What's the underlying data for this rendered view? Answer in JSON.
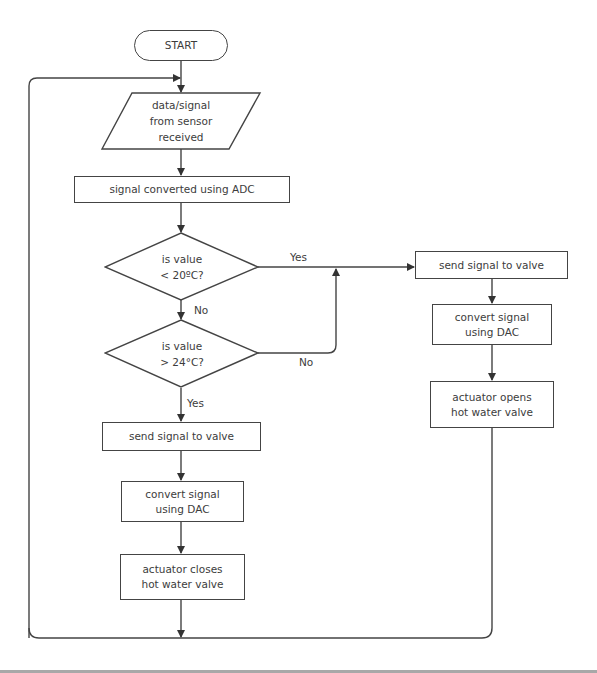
{
  "diagram": {
    "type": "flowchart",
    "title": "",
    "colors": {
      "stroke": "#444444",
      "text": "#3c3c3c",
      "background": "#ffffff",
      "rule": "#a8a8a8"
    },
    "nodes": {
      "start": {
        "shape": "terminator",
        "lines": [
          "START"
        ]
      },
      "input": {
        "shape": "parallelogram",
        "lines": [
          "data/signal",
          "from sensor",
          "received"
        ]
      },
      "adc": {
        "shape": "process",
        "lines": [
          "signal converted using ADC"
        ]
      },
      "decision_low": {
        "shape": "decision",
        "lines": [
          "is value",
          "< 20ºC?"
        ]
      },
      "decision_high": {
        "shape": "decision",
        "lines": [
          "is value",
          "> 24°C?"
        ]
      },
      "left_send": {
        "shape": "process",
        "lines": [
          "send signal to valve"
        ]
      },
      "left_dac": {
        "shape": "process",
        "lines": [
          "convert signal",
          "using DAC"
        ]
      },
      "left_actuator": {
        "shape": "process",
        "lines": [
          "actuator closes",
          "hot water valve"
        ]
      },
      "right_send": {
        "shape": "process",
        "lines": [
          "send signal to valve"
        ]
      },
      "right_dac": {
        "shape": "process",
        "lines": [
          "convert signal",
          "using DAC"
        ]
      },
      "right_actuator": {
        "shape": "process",
        "lines": [
          "actuator opens",
          "hot water valve"
        ]
      }
    },
    "edge_labels": {
      "low_yes": "Yes",
      "low_no": "No",
      "high_no": "No",
      "high_yes": "Yes"
    },
    "edges": [
      {
        "from": "start",
        "to": "input"
      },
      {
        "from": "input",
        "to": "adc"
      },
      {
        "from": "adc",
        "to": "decision_low"
      },
      {
        "from": "decision_low",
        "to": "right_send",
        "label": "Yes"
      },
      {
        "from": "decision_low",
        "to": "decision_high",
        "label": "No"
      },
      {
        "from": "decision_high",
        "to": "right_send",
        "label": "No"
      },
      {
        "from": "decision_high",
        "to": "left_send",
        "label": "Yes"
      },
      {
        "from": "left_send",
        "to": "left_dac"
      },
      {
        "from": "left_dac",
        "to": "left_actuator"
      },
      {
        "from": "right_send",
        "to": "right_dac"
      },
      {
        "from": "right_dac",
        "to": "right_actuator"
      },
      {
        "from": "left_actuator",
        "to": "input",
        "note": "loop back"
      },
      {
        "from": "right_actuator",
        "to": "input",
        "note": "loop back"
      }
    ]
  }
}
